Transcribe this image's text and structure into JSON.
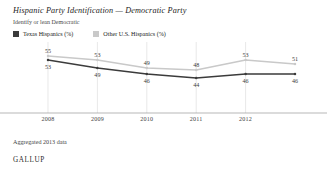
{
  "header": {
    "title": "Hispanic Party Identification — Democratic Party",
    "subtitle": "Identify or lean Democratic"
  },
  "footer": {
    "note": "Aggregated 2013 data",
    "brand": "GALLUP"
  },
  "colors": {
    "texas": "#3b3b3b",
    "other": "#c9c9c9",
    "gridline": "#d8d8d8",
    "axis": "#9a9a9a",
    "text": "#2b2b2b"
  },
  "chart_data": {
    "type": "line",
    "title": "Hispanic Party Identification — Democratic Party",
    "subtitle": "Identify or lean Democratic",
    "xlabel": "",
    "ylabel": "",
    "ylim": [
      40,
      58
    ],
    "grid": true,
    "legend_position": "top-left",
    "categories": [
      "2008",
      "2009",
      "2010",
      "2011",
      "2012",
      "2013"
    ],
    "tick_labels": [
      "2008",
      "2009",
      "2010",
      "2011",
      "2012"
    ],
    "series": [
      {
        "name": "Texas Hispanics (%)",
        "color": "#3b3b3b",
        "values": [
          53,
          49,
          46,
          44,
          46,
          46
        ],
        "label_position": "below"
      },
      {
        "name": "Other U.S. Hispanics (%)",
        "color": "#c9c9c9",
        "values": [
          55,
          53,
          49,
          48,
          53,
          51
        ],
        "label_position": "above"
      }
    ]
  }
}
